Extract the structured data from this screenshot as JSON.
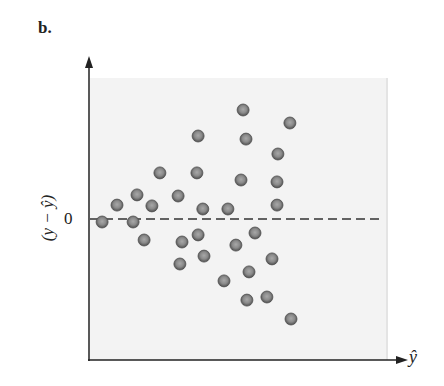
{
  "panel_label": "b.",
  "chart_data": {
    "type": "scatter",
    "title": "",
    "xlabel": "ŷ",
    "ylabel": "(y − ŷ)",
    "y_tick_labels": [
      "0"
    ],
    "reference_line": {
      "y": 0,
      "style": "dashed"
    },
    "xlim": [
      0,
      10
    ],
    "ylim": [
      -5,
      5
    ],
    "grid": false,
    "legend": null,
    "points": [
      {
        "x": 0.44,
        "y": -0.07
      },
      {
        "x": 0.94,
        "y": 0.53
      },
      {
        "x": 1.61,
        "y": 0.89
      },
      {
        "x": 1.48,
        "y": -0.07
      },
      {
        "x": 2.11,
        "y": 0.5
      },
      {
        "x": 2.38,
        "y": 1.67
      },
      {
        "x": 1.85,
        "y": -0.71
      },
      {
        "x": 2.99,
        "y": 0.85
      },
      {
        "x": 3.62,
        "y": 1.67
      },
      {
        "x": 3.66,
        "y": 2.98
      },
      {
        "x": 3.12,
        "y": -0.78
      },
      {
        "x": 3.66,
        "y": -0.53
      },
      {
        "x": 3.05,
        "y": -1.56
      },
      {
        "x": 3.82,
        "y": 0.39
      },
      {
        "x": 3.86,
        "y": -1.28
      },
      {
        "x": 4.66,
        "y": 0.39
      },
      {
        "x": 4.53,
        "y": -2.16
      },
      {
        "x": 4.93,
        "y": -0.89
      },
      {
        "x": 5.17,
        "y": 3.9
      },
      {
        "x": 5.27,
        "y": 2.87
      },
      {
        "x": 5.1,
        "y": 1.42
      },
      {
        "x": 5.57,
        "y": -0.46
      },
      {
        "x": 5.37,
        "y": -1.84
      },
      {
        "x": 5.3,
        "y": -2.84
      },
      {
        "x": 6.14,
        "y": -1.38
      },
      {
        "x": 5.97,
        "y": -2.73
      },
      {
        "x": 6.31,
        "y": 0.53
      },
      {
        "x": 6.31,
        "y": 1.35
      },
      {
        "x": 6.34,
        "y": 2.34
      },
      {
        "x": 6.74,
        "y": 3.44
      },
      {
        "x": 6.78,
        "y": -3.51
      }
    ]
  },
  "colors": {
    "plot_background": "#f3f3f3",
    "point_fill": "#8a8a8a",
    "point_edge": "#505050",
    "axis": "#222222"
  }
}
